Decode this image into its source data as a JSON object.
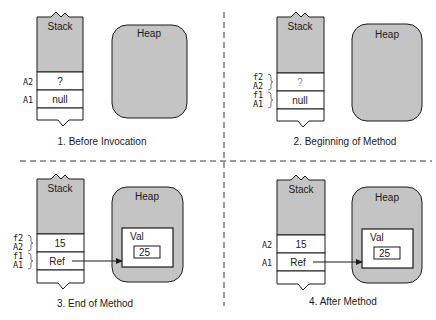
{
  "colors": {
    "gray_fill": "#c4c4c4",
    "stroke": "#1a1a1a",
    "divider": "#3a3a3a",
    "muted_text": "#8a8a8a"
  },
  "panels": [
    {
      "caption": "1. Before Invocation",
      "stack": {
        "title": "Stack",
        "slots": [
          {
            "labels": [
              "A2"
            ],
            "value": "?"
          },
          {
            "labels": [
              "A1"
            ],
            "value": "null"
          }
        ]
      },
      "heap": {
        "title": "Heap"
      }
    },
    {
      "caption": "2. Beginning of Method",
      "stack": {
        "title": "Stack",
        "slots": [
          {
            "labels": [
              "f2",
              "A2"
            ],
            "value": "?"
          },
          {
            "labels": [
              "f1",
              "A1"
            ],
            "value": "null"
          }
        ]
      },
      "heap": {
        "title": "Heap"
      }
    },
    {
      "caption": "3. End of Method",
      "stack": {
        "title": "Stack",
        "slots": [
          {
            "labels": [
              "f2",
              "A2"
            ],
            "value": "15"
          },
          {
            "labels": [
              "f1",
              "A1"
            ],
            "value": "Ref"
          }
        ]
      },
      "heap": {
        "title": "Heap",
        "object": {
          "label": "Val",
          "value": "25"
        }
      }
    },
    {
      "caption": "4. After Method",
      "stack": {
        "title": "Stack",
        "slots": [
          {
            "labels": [
              "A2"
            ],
            "value": "15"
          },
          {
            "labels": [
              "A1"
            ],
            "value": "Ref"
          }
        ]
      },
      "heap": {
        "title": "Heap",
        "object": {
          "label": "Val",
          "value": "25"
        }
      }
    }
  ]
}
